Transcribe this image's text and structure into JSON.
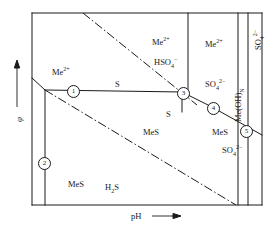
{
  "figure": {
    "kind": "eh-ph-pourbaix-diagram",
    "background": "#ffffff",
    "line_color": "#1a1a1a",
    "frame": {
      "x": 32,
      "y": 13,
      "width": 230,
      "height": 192
    }
  },
  "axes": {
    "x": {
      "label": "pH",
      "arrow": "⟶",
      "arrow_direction": "right"
    },
    "y": {
      "label": "φ",
      "arrow_direction": "up"
    }
  },
  "region_labels": [
    {
      "id": "me2plus-upper-left",
      "base": "Me",
      "sup": "2+",
      "sub": "",
      "x": 52,
      "y": 68,
      "rotated": false
    },
    {
      "id": "s-upper-middle",
      "base": "S",
      "sup": "",
      "sub": "",
      "x": 115,
      "y": 80,
      "rotated": false
    },
    {
      "id": "me2plus-middle-top",
      "base": "Me",
      "sup": "2+",
      "sub": "",
      "x": 152,
      "y": 38,
      "rotated": false
    },
    {
      "id": "hso4-minus",
      "base": "HSO",
      "sup": "−",
      "sub": "4",
      "x": 154,
      "y": 58,
      "rotated": false
    },
    {
      "id": "me2plus-right-top",
      "base": "Me",
      "sup": "2+",
      "sub": "",
      "x": 205,
      "y": 40,
      "rotated": false
    },
    {
      "id": "so4-2minus-right-top",
      "base": "SO",
      "sup": "2−",
      "sub": "4",
      "x": 205,
      "y": 80,
      "rotated": false
    },
    {
      "id": "s-below-node3",
      "base": "S",
      "sup": "",
      "sub": "",
      "x": 166,
      "y": 110,
      "rotated": false
    },
    {
      "id": "mes-center",
      "base": "MeS",
      "sup": "",
      "sub": "",
      "x": 143,
      "y": 128,
      "rotated": false
    },
    {
      "id": "mes-right",
      "base": "MeS",
      "sup": "",
      "sub": "",
      "x": 212,
      "y": 128,
      "rotated": false
    },
    {
      "id": "so4-2minus-lower-right",
      "base": "SO",
      "sup": "2−",
      "sub": "4",
      "x": 222,
      "y": 146,
      "rotated": false
    },
    {
      "id": "mes-lower-left",
      "base": "MeS",
      "sup": "",
      "sub": "",
      "x": 68,
      "y": 180,
      "rotated": false
    },
    {
      "id": "h2s",
      "base": "H",
      "sup": "",
      "sub": "2",
      "tail": "S",
      "x": 105,
      "y": 183,
      "rotated": false
    },
    {
      "id": "me-oh-n-vertical-band",
      "base": "Me(OH)",
      "sup": "",
      "sub": "N",
      "x": 234,
      "y": 122,
      "rotated": true
    },
    {
      "id": "so4-2minus-far-right-vertical",
      "base": "SO",
      "sup": "2−",
      "sub": "4",
      "x": 254,
      "y": 50,
      "rotated": true
    }
  ],
  "node_markers": [
    {
      "label": "1",
      "x": 67,
      "y": 85
    },
    {
      "label": "2",
      "x": 38,
      "y": 157
    },
    {
      "label": "3",
      "x": 177,
      "y": 87
    },
    {
      "label": "4",
      "x": 207,
      "y": 102
    },
    {
      "label": "5",
      "x": 240,
      "y": 125
    }
  ],
  "solid_lines": [
    {
      "id": "frame-left",
      "points": "32,13 32,205"
    },
    {
      "id": "frame-top",
      "points": "32,13 262,13"
    },
    {
      "id": "frame-right",
      "points": "262,13 262,205"
    },
    {
      "id": "frame-bottom",
      "points": "32,205 262,205"
    },
    {
      "id": "boundary-node1-left-edge",
      "points": "32,78 45,90"
    },
    {
      "id": "boundary-node1-to-node3",
      "points": "45,90 182,92"
    },
    {
      "id": "boundary-node2-vertical",
      "points": "45,90 45,205"
    },
    {
      "id": "boundary-node3-to-node4-to-node5",
      "points": "182,92 212,107 262,135"
    },
    {
      "id": "boundary-vertical-hso4-so4",
      "points": "188,13 188,97"
    },
    {
      "id": "boundary-vertical-meoh-left",
      "points": "238,13 238,205"
    },
    {
      "id": "boundary-vertical-meoh-right",
      "points": "248,13 248,205"
    },
    {
      "id": "boundary-node3-short-vertical",
      "points": "182,92 182,112"
    }
  ],
  "dashdot_lines": [
    {
      "id": "upper-hydrogen-line",
      "points": "83,13 197,105"
    },
    {
      "id": "lower-oxygen-line",
      "points": "45,90 236,205"
    }
  ]
}
